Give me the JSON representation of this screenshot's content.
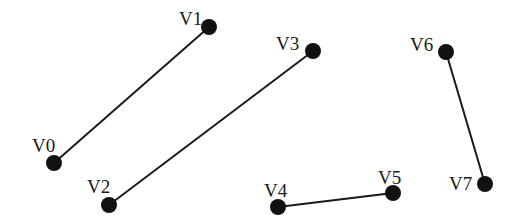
{
  "figure": {
    "background_color": "#ffffff",
    "stroke_color": "#1a1a1a",
    "dot_color": "#111111",
    "width": 519,
    "height": 222
  },
  "chart_data": {
    "type": "scatter",
    "title": "",
    "xlabel": "",
    "ylabel": "",
    "vertices": [
      {
        "id": "V0",
        "label": "V0",
        "x": 54,
        "y": 163,
        "label_x": 32,
        "label_y": 152
      },
      {
        "id": "V1",
        "label": "V1",
        "x": 209,
        "y": 27,
        "label_x": 179,
        "label_y": 25
      },
      {
        "id": "V2",
        "label": "V2",
        "x": 109,
        "y": 205,
        "label_x": 87,
        "label_y": 193
      },
      {
        "id": "V3",
        "label": "V3",
        "x": 313,
        "y": 51,
        "label_x": 276,
        "label_y": 50
      },
      {
        "id": "V4",
        "label": "V4",
        "x": 278,
        "y": 207,
        "label_x": 264,
        "label_y": 197
      },
      {
        "id": "V5",
        "label": "V5",
        "x": 393,
        "y": 193,
        "label_x": 378,
        "label_y": 184
      },
      {
        "id": "V6",
        "label": "V6",
        "x": 446,
        "y": 52,
        "label_x": 410,
        "label_y": 51
      },
      {
        "id": "V7",
        "label": "V7",
        "x": 485,
        "y": 184,
        "label_x": 449,
        "label_y": 190
      }
    ],
    "edges": [
      {
        "id": "E0",
        "from": "V0",
        "to": "V1",
        "x1": 54,
        "y1": 163,
        "x2": 209,
        "y2": 27
      },
      {
        "id": "E1",
        "from": "V2",
        "to": "V3",
        "x1": 109,
        "y1": 205,
        "x2": 313,
        "y2": 51
      },
      {
        "id": "E2",
        "from": "V4",
        "to": "V5",
        "x1": 278,
        "y1": 207,
        "x2": 393,
        "y2": 193
      },
      {
        "id": "E3",
        "from": "V6",
        "to": "V7",
        "x1": 446,
        "y1": 52,
        "x2": 485,
        "y2": 184
      }
    ],
    "dot_radius": 8,
    "line_width": 2
  }
}
